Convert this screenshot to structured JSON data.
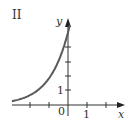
{
  "panel": {
    "label": "II"
  },
  "chart_data": {
    "type": "line",
    "title": "II",
    "xlabel": "x",
    "ylabel": "y",
    "x_tick_labels": [
      "0",
      "1"
    ],
    "y_tick_labels": [
      "1"
    ],
    "xlim": [
      -2.9,
      2.9
    ],
    "ylim": [
      -0.7,
      5.9
    ],
    "grid": false,
    "legend": null,
    "series": [
      {
        "name": "exponential curve",
        "function": "y ≈ 5·e^x",
        "x": [
          -2.9,
          -2.5,
          -2,
          -1.5,
          -1,
          -0.75,
          -0.5,
          -0.25,
          0,
          0.1
        ],
        "y": [
          0.28,
          0.41,
          0.68,
          1.12,
          1.84,
          2.36,
          3.03,
          3.89,
          5.0,
          5.5
        ]
      }
    ],
    "colors": {
      "curve": "#5a5a5a",
      "axes": "#333333"
    }
  },
  "axes": {
    "x_label": "x",
    "y_label": "y",
    "origin_label": "0",
    "x_one_label": "1",
    "y_one_label": "1"
  }
}
